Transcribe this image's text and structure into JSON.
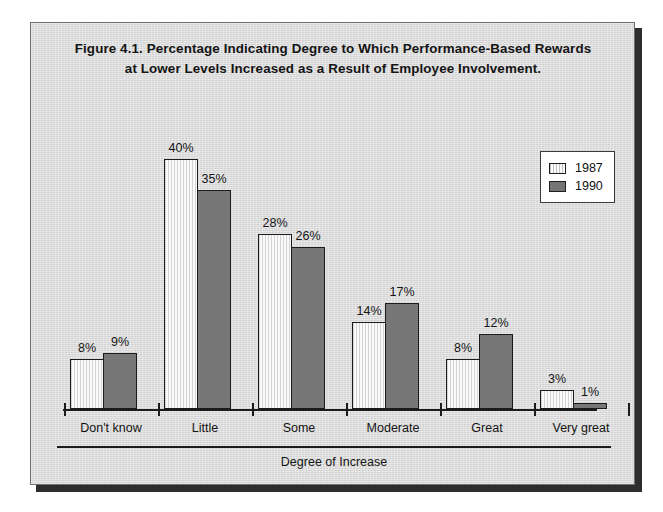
{
  "figure": {
    "title_line1": "Figure 4.1. Percentage Indicating Degree to Which Performance-Based Rewards",
    "title_line2": "at Lower Levels Increased as a Result of Employee Involvement."
  },
  "legend": {
    "position": "top-right",
    "entries": [
      {
        "label": "1987",
        "swatch": "white-hatched",
        "color": "#fafafa"
      },
      {
        "label": "1990",
        "swatch": "solid-gray",
        "color": "#777777"
      }
    ]
  },
  "colors": {
    "panel_background": "#dedede",
    "panel_border": "#6f6f6f",
    "bar_1987": "#fafafa",
    "bar_1990": "#777777",
    "ink": "#1b1b1b"
  },
  "chart_data": {
    "type": "bar",
    "title": "Figure 4.1. Percentage Indicating Degree to Which Performance-Based Rewards at Lower Levels Increased as a Result of Employee Involvement.",
    "xlabel": "Degree of Increase",
    "ylabel": "",
    "ylim": [
      0,
      40
    ],
    "grid": false,
    "legend_position": "top-right",
    "categories": [
      "Don't know",
      "Little",
      "Some",
      "Moderate",
      "Great",
      "Very great"
    ],
    "series": [
      {
        "name": "1987",
        "values": [
          8,
          40,
          28,
          14,
          8,
          3
        ],
        "value_labels": [
          "8%",
          "40%",
          "28%",
          "14%",
          "8%",
          "3%"
        ]
      },
      {
        "name": "1990",
        "values": [
          9,
          35,
          26,
          17,
          12,
          1
        ],
        "value_labels": [
          "9%",
          "35%",
          "26%",
          "17%",
          "12%",
          "1%"
        ]
      }
    ]
  }
}
